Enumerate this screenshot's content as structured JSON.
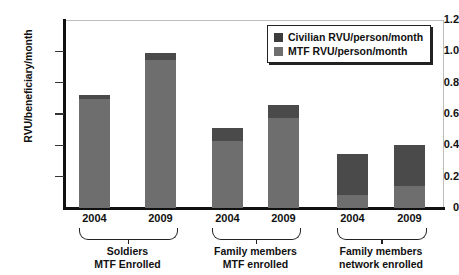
{
  "chart_data": {
    "type": "bar",
    "title": "",
    "xlabel": "",
    "ylabel": "RVU/beneficiary/month",
    "ylim": [
      0,
      1.2
    ],
    "yticks": [
      "0",
      "0.2",
      "0.4",
      "0.6",
      "0.8",
      "1.0",
      "1.2"
    ],
    "ytick_values": [
      0,
      0.2,
      0.4,
      0.6,
      0.8,
      1.0,
      1.2
    ],
    "grid": false,
    "stacked": true,
    "legend_position": "top-right",
    "categories": [
      "2004",
      "2009",
      "2004",
      "2009",
      "2004",
      "2009"
    ],
    "groups": [
      {
        "label_line1": "Soldiers",
        "label_line2": "MTF Enrolled",
        "categories": [
          "2004",
          "2009"
        ]
      },
      {
        "label_line1": "Family members",
        "label_line2": "MTF enrolled",
        "categories": [
          "2004",
          "2009"
        ]
      },
      {
        "label_line1": "Family members",
        "label_line2": "network enrolled",
        "categories": [
          "2004",
          "2009"
        ]
      }
    ],
    "series": [
      {
        "name": "MTF RVU/person/month",
        "color": "#6e6e6e",
        "values": [
          0.695,
          0.945,
          0.43,
          0.575,
          0.08,
          0.14
        ]
      },
      {
        "name": "Civilian RVU/person/month",
        "color": "#4a4a4a",
        "values": [
          0.025,
          0.045,
          0.08,
          0.085,
          0.265,
          0.26
        ]
      }
    ],
    "totals": [
      0.72,
      0.99,
      0.51,
      0.66,
      0.345,
      0.4
    ]
  },
  "legend": {
    "items": [
      {
        "label": "Civilian RVU/person/month",
        "swatch": "civ"
      },
      {
        "label": "MTF RVU/person/month",
        "swatch": "mtf"
      }
    ]
  },
  "colors": {
    "civilian": "#4a4a4a",
    "mtf": "#6e6e6e",
    "axis": "#111111",
    "frame": "#bdbdbd"
  }
}
